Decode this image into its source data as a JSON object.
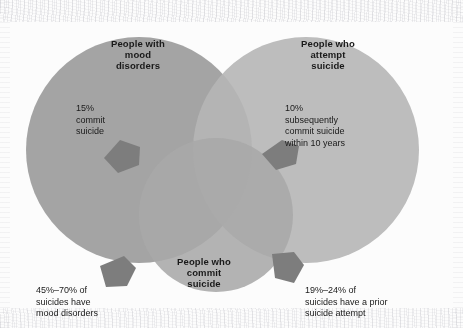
{
  "diagram": {
    "type": "venn",
    "sets": [
      {
        "id": "mood-disorders",
        "title": "People with\nmood\ndisorders",
        "fill": "#9a9a9a",
        "cx": 139,
        "cy": 150,
        "r": 113
      },
      {
        "id": "attempt-suicide",
        "title": "People who\nattempt\nsuicide",
        "fill": "#b5b5b5",
        "cx": 306,
        "cy": 150,
        "r": 113
      },
      {
        "id": "commit-suicide",
        "title": "People who\ncommit\nsuicide",
        "fill": "#a8a8a8",
        "cx": 216,
        "cy": 215,
        "r": 77
      }
    ],
    "annotations": [
      {
        "id": "left-stat",
        "text": "15%\ncommit\nsuicide",
        "points_to": "mood-disorders-to-commit-suicide"
      },
      {
        "id": "right-stat",
        "text": "10%\nsubsequently\ncommit suicide\nwithin 10 years",
        "points_to": "attempt-suicide-to-commit-suicide"
      },
      {
        "id": "left-caption",
        "text": "45%–70% of\nsuicides have\nmood disorders",
        "points_to": "commit-suicide-to-mood-disorders"
      },
      {
        "id": "right-caption",
        "text": "19%–24% of\nsuicides have a prior\nsuicide attempt",
        "points_to": "commit-suicide-to-attempt-suicide"
      }
    ],
    "pointer_color": "#7b7b7b",
    "background": "#fcfcfc",
    "text_color": "#1a1a1a"
  }
}
